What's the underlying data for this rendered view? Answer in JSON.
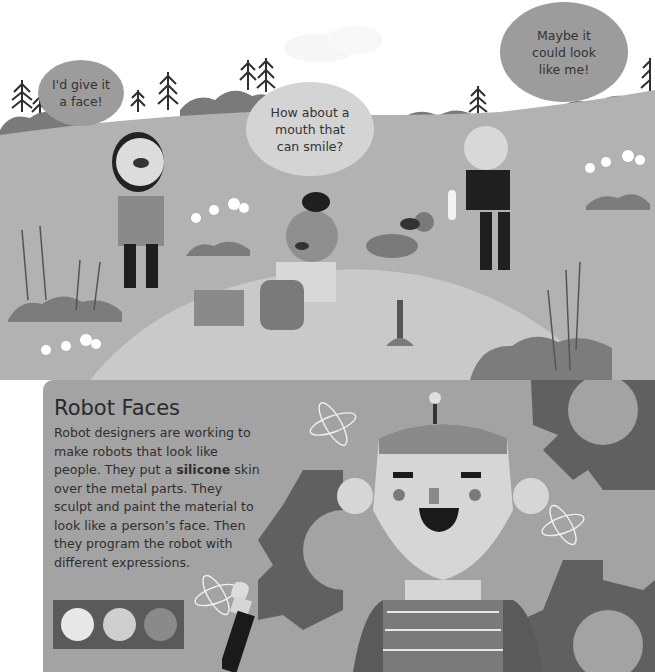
{
  "header": {
    "clipped_glyph": "g"
  },
  "scene": {
    "bubbles": [
      {
        "id": "girl",
        "lines": [
          "I'd give it",
          "a face!"
        ]
      },
      {
        "id": "boy",
        "lines": [
          "How about a",
          "mouth that",
          "can smile?"
        ]
      },
      {
        "id": "ponytail-girl",
        "lines": [
          "Maybe it",
          "could look",
          "like me!"
        ]
      }
    ]
  },
  "info": {
    "title": "Robot Faces",
    "body_parts": [
      "Robot designers are working to make robots that look like people. They put a ",
      "silicone",
      " skin over the metal parts. They sculpt and paint the material to look like a person’s face. Then they program the robot with different expressions."
    ]
  },
  "palette": {
    "swatches": [
      "#e8e8e8",
      "#cfcfcf",
      "#8a8a8a"
    ]
  },
  "colors": {
    "sky": "#ffffff",
    "hill": "#b4b4b4",
    "dark_hill": "#7e7e7e",
    "sand": "#cacaca",
    "panel": "#a3a3a3",
    "gear": "#606060",
    "robot_face": "#d6d6d6"
  }
}
